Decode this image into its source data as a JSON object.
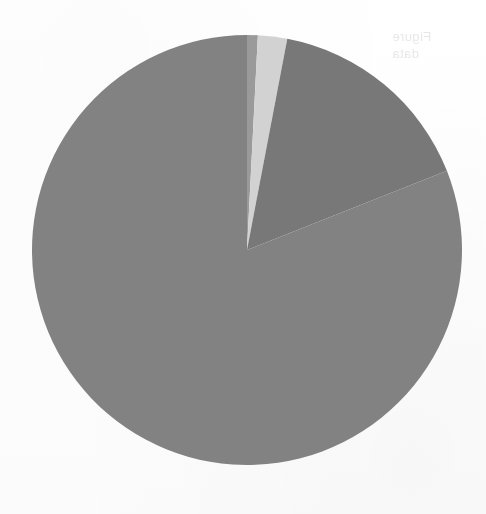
{
  "page": {
    "background_color": "#fefefe",
    "width": 486,
    "height": 514
  },
  "bleed_through": {
    "line1": "Figure",
    "line2": "data",
    "note": "faint reverse-side scan bleed-through, illegible"
  },
  "chart_data": {
    "type": "pie",
    "title": "",
    "subtitle": "",
    "xlabel": "",
    "ylabel": "",
    "legend_position": "none",
    "grid": false,
    "start_angle_deg": 0,
    "direction": "clockwise",
    "center": {
      "x": 247,
      "y": 250
    },
    "radius": 215,
    "labels": [
      "Slice 1",
      "Slice 2",
      "Slice 3",
      "Slice 4"
    ],
    "values": [
      0.8,
      2.2,
      16.0,
      81.0
    ],
    "units": "%",
    "colors": [
      "#9a9a9a",
      "#d2d2d2",
      "#787878",
      "#828282"
    ],
    "slices": [
      {
        "label": "Slice 1",
        "value": 0.8,
        "percent": "0.8%",
        "color": "#9a9a9a",
        "start_angle_deg": 0,
        "end_angle_deg": 2.9
      },
      {
        "label": "Slice 2",
        "value": 2.2,
        "percent": "2.2%",
        "color": "#d2d2d2",
        "start_angle_deg": 2.9,
        "end_angle_deg": 10.8
      },
      {
        "label": "Slice 3",
        "value": 16.0,
        "percent": "16.0%",
        "color": "#787878",
        "start_angle_deg": 10.8,
        "end_angle_deg": 68.4
      },
      {
        "label": "Slice 4",
        "value": 81.0,
        "percent": "81.0%",
        "color": "#828282",
        "start_angle_deg": 68.4,
        "end_angle_deg": 360
      }
    ]
  }
}
